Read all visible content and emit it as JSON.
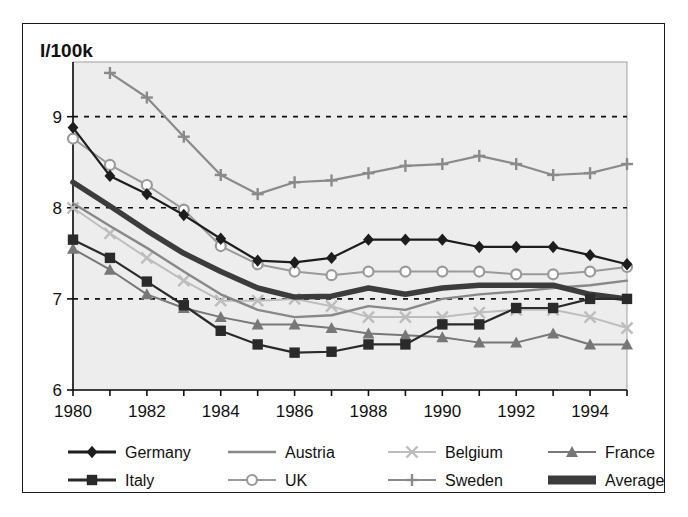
{
  "figure": {
    "title": "I/100k",
    "border_color": "#1a1a1a",
    "plot_bg": "#ededed"
  },
  "chart_data": {
    "type": "line",
    "title": "I/100k",
    "xlabel": "",
    "ylabel": "I/100k",
    "ylim": [
      6,
      9.6
    ],
    "xlim": [
      1980,
      1995
    ],
    "grid": "horizontal dashed at 7, 8, 9",
    "y_ticks": [
      6,
      7,
      8,
      9
    ],
    "x_ticks": [
      1980,
      1981,
      1982,
      1983,
      1984,
      1985,
      1986,
      1987,
      1988,
      1989,
      1990,
      1991,
      1992,
      1993,
      1994,
      1995
    ],
    "x_tick_labels": [
      "1980",
      "",
      "1982",
      "",
      "1984",
      "",
      "1986",
      "",
      "1988",
      "",
      "1990",
      "",
      "1992",
      "",
      "1994",
      ""
    ],
    "legend_position": "bottom",
    "x": [
      1980,
      1981,
      1982,
      1983,
      1984,
      1985,
      1986,
      1987,
      1988,
      1989,
      1990,
      1991,
      1992,
      1993,
      1994,
      1995
    ],
    "series": [
      {
        "name": "Germany",
        "color": "#1d1d1d",
        "marker": "diamond",
        "width": 2.2,
        "values": [
          8.88,
          8.35,
          8.15,
          7.92,
          7.66,
          7.42,
          7.4,
          7.45,
          7.65,
          7.65,
          7.65,
          7.57,
          7.57,
          7.57,
          7.48,
          7.38
        ]
      },
      {
        "name": "Italy",
        "color": "#2a2a2a",
        "marker": "square",
        "width": 2.2,
        "values": [
          7.65,
          7.45,
          7.19,
          6.93,
          6.65,
          6.5,
          6.41,
          6.42,
          6.5,
          6.5,
          6.72,
          6.72,
          6.9,
          6.9,
          7.0,
          7.0
        ]
      },
      {
        "name": "Austria",
        "color": "#888888",
        "marker": "none",
        "width": 2.4,
        "values": [
          8.05,
          7.8,
          7.56,
          7.3,
          7.05,
          6.88,
          6.8,
          6.82,
          6.92,
          6.88,
          7.0,
          7.05,
          7.08,
          7.12,
          7.15,
          7.2
        ]
      },
      {
        "name": "UK",
        "color": "#9a9a9a",
        "marker": "circle",
        "width": 2.0,
        "values": [
          8.76,
          8.47,
          8.25,
          7.98,
          7.58,
          7.38,
          7.3,
          7.26,
          7.3,
          7.3,
          7.3,
          7.3,
          7.27,
          7.27,
          7.3,
          7.35
        ]
      },
      {
        "name": "Belgium",
        "color": "#bdbdbd",
        "marker": "cross",
        "width": 2.0,
        "values": [
          8.0,
          7.72,
          7.45,
          7.2,
          6.98,
          6.98,
          7.0,
          6.92,
          6.8,
          6.8,
          6.8,
          6.85,
          6.88,
          6.88,
          6.8,
          6.68
        ]
      },
      {
        "name": "Sweden",
        "color": "#8a8a8a",
        "marker": "plus",
        "width": 2.2,
        "values": [
          null,
          9.48,
          9.21,
          8.78,
          8.36,
          8.15,
          8.28,
          8.3,
          8.38,
          8.46,
          8.48,
          8.57,
          8.48,
          8.36,
          8.38,
          8.48
        ]
      },
      {
        "name": "France",
        "color": "#777777",
        "marker": "triangle",
        "width": 2.0,
        "values": [
          7.55,
          7.32,
          7.05,
          6.9,
          6.8,
          6.72,
          6.72,
          6.68,
          6.62,
          6.6,
          6.58,
          6.52,
          6.52,
          6.62,
          6.5,
          6.5
        ]
      },
      {
        "name": "Average",
        "color": "#3c3c3c",
        "marker": "none",
        "width": 5.5,
        "values": [
          8.28,
          8.02,
          7.75,
          7.5,
          7.3,
          7.12,
          7.02,
          7.03,
          7.12,
          7.05,
          7.12,
          7.15,
          7.15,
          7.15,
          7.05,
          7.0
        ]
      }
    ]
  },
  "legend": {
    "entries": [
      {
        "label": "Germany",
        "color": "#1d1d1d",
        "marker": "diamond",
        "width": 3
      },
      {
        "label": "Austria",
        "color": "#888888",
        "marker": "none",
        "width": 2.5
      },
      {
        "label": "Belgium",
        "color": "#bdbdbd",
        "marker": "cross",
        "width": 2
      },
      {
        "label": "France",
        "color": "#777777",
        "marker": "triangle",
        "width": 2
      },
      {
        "label": "Italy",
        "color": "#2a2a2a",
        "marker": "square",
        "width": 3
      },
      {
        "label": "UK",
        "color": "#9a9a9a",
        "marker": "circle",
        "width": 2
      },
      {
        "label": "Sweden",
        "color": "#8a8a8a",
        "marker": "plus",
        "width": 2
      },
      {
        "label": "Average",
        "color": "#3c3c3c",
        "marker": "none",
        "width": 8
      }
    ]
  }
}
